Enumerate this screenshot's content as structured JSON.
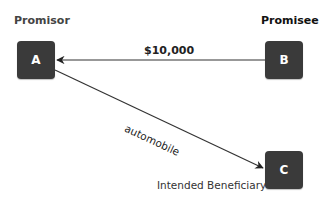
{
  "diagram": {
    "nodes": [
      {
        "id": "A",
        "letter": "A",
        "role": "Promisor"
      },
      {
        "id": "B",
        "letter": "B",
        "role": "Promisee"
      },
      {
        "id": "C",
        "letter": "C",
        "role": "Intended Beneficiary"
      }
    ],
    "edges": [
      {
        "from": "B",
        "to": "A",
        "label": "$10,000"
      },
      {
        "from": "A",
        "to": "C",
        "label": "automobile"
      }
    ],
    "colors": {
      "node_fill": "#3a3a3a",
      "node_text": "#ffffff",
      "edge": "#333333"
    }
  }
}
